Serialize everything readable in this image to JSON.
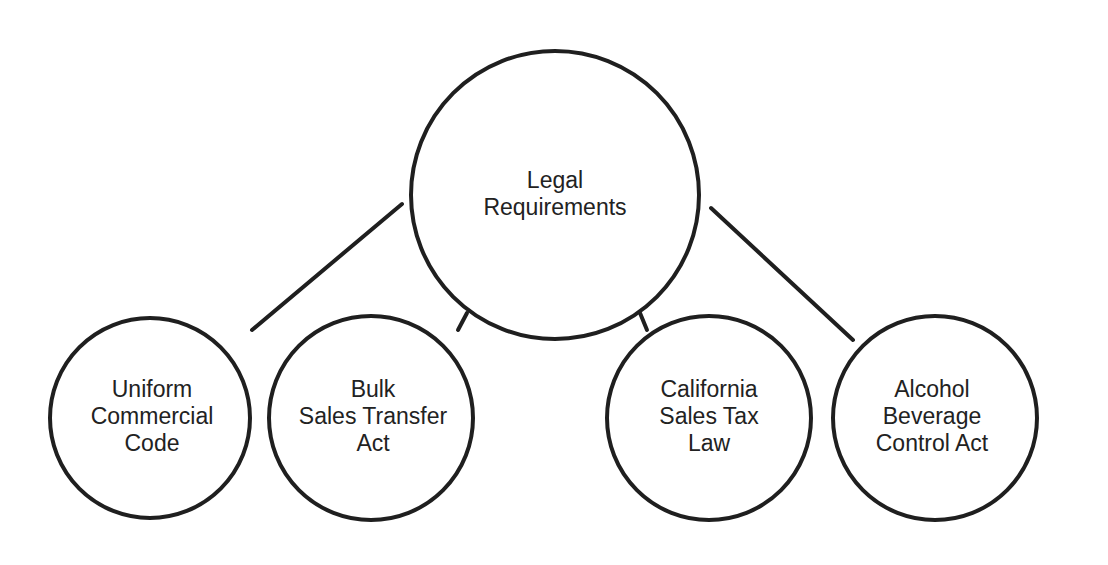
{
  "diagram": {
    "root": {
      "id": "legal-requirements",
      "lines": [
        "Legal",
        "Requirements"
      ]
    },
    "children": [
      {
        "id": "uniform-commercial-code",
        "lines": [
          "Uniform",
          "Commercial",
          "Code"
        ],
        "connector": "line"
      },
      {
        "id": "bulk-sales-transfer-act",
        "lines": [
          "Bulk",
          "Sales Transfer",
          "Act"
        ],
        "connector": "tick"
      },
      {
        "id": "california-sales-tax-law",
        "lines": [
          "California",
          "Sales Tax",
          "Law"
        ],
        "connector": "tick"
      },
      {
        "id": "alcohol-beverage-control-act",
        "lines": [
          "Alcohol",
          "Beverage",
          "Control Act"
        ],
        "connector": "line"
      }
    ],
    "colors": {
      "stroke": "#1f1f1f",
      "text": "#222222",
      "background": "#ffffff"
    }
  }
}
